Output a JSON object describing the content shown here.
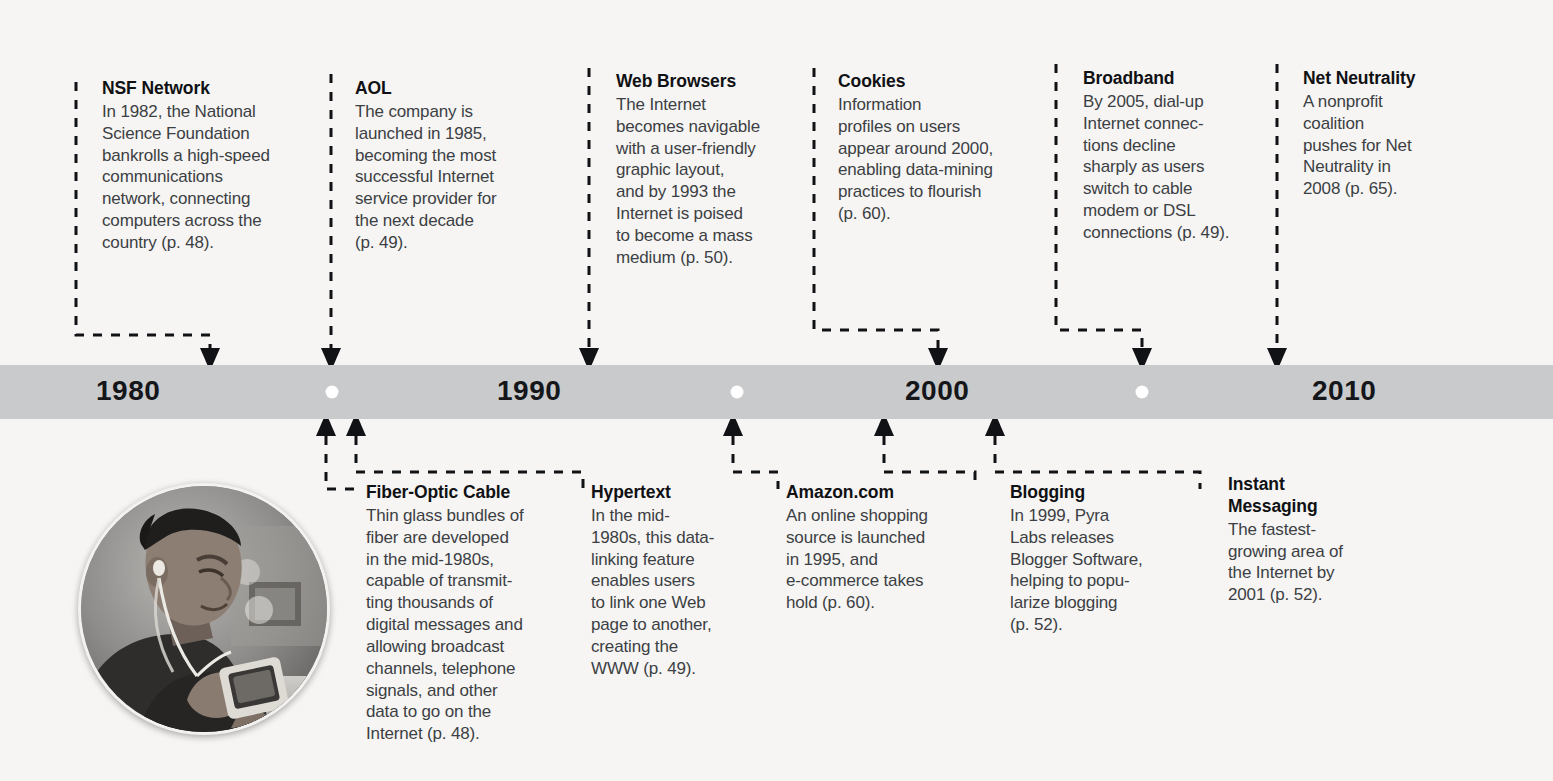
{
  "timeline": {
    "years": [
      {
        "label": "1980",
        "x": 96
      },
      {
        "label": "1990",
        "x": 497
      },
      {
        "label": "2000",
        "x": 905
      },
      {
        "label": "2010",
        "x": 1312
      }
    ],
    "dots": [
      {
        "name": "decade-marker-1985",
        "x": 332
      },
      {
        "name": "decade-marker-1995",
        "x": 737
      },
      {
        "name": "decade-marker-2005",
        "x": 1142
      }
    ],
    "bar_color": "#c9cacb",
    "background_color": "#f6f5f3",
    "ink_color": "#111216"
  },
  "entries_above": [
    {
      "id": "nsf-network",
      "title": "NSF Network",
      "body": "In 1982, the National\nScience Foundation\nbankrolls a high-speed\ncommunications\nnetwork, connecting\ncomputers across the\ncountry (p. 48)."
    },
    {
      "id": "aol",
      "title": "AOL",
      "body": "The company is\nlaunched in 1985,\nbecoming the most\nsuccessful Internet\nservice provider for\nthe next decade\n(p. 49)."
    },
    {
      "id": "web-browsers",
      "title": "Web Browsers",
      "body": "The Internet\nbecomes navigable\nwith a user-friendly\ngraphic layout,\nand by 1993 the\nInternet is poised\nto become a mass\nmedium (p. 50)."
    },
    {
      "id": "cookies",
      "title": "Cookies",
      "body": "Information\nprofiles on users\nappear around 2000,\nenabling data-mining\npractices to flourish\n(p. 60)."
    },
    {
      "id": "broadband",
      "title": "Broadband",
      "body": "By 2005, dial-up\nInternet connec-\ntions decline\nsharply as users\nswitch to cable\nmodem or DSL\nconnections (p. 49)."
    },
    {
      "id": "net-neutrality",
      "title": "Net Neutrality",
      "body": "A nonprofit\ncoalition\npushes for Net\nNeutrality in\n2008 (p. 65)."
    }
  ],
  "entries_below": [
    {
      "id": "fiber-optic-cable",
      "title": "Fiber-Optic Cable",
      "body": "Thin glass bundles of\nfiber are developed\nin the mid-1980s,\ncapable of transmit-\nting thousands of\ndigital messages and\nallowing broadcast\nchannels, telephone\nsignals, and other\ndata to go on the\nInternet (p. 48)."
    },
    {
      "id": "hypertext",
      "title": "Hypertext",
      "body": "In the mid-\n1980s, this data-\nlinking feature\nenables users\nto link one Web\npage to another,\ncreating the\nWWW (p. 49)."
    },
    {
      "id": "amazon-com",
      "title": "Amazon.com",
      "body": "An online shopping\nsource is launched\nin 1995, and\ne-commerce takes\nhold (p. 60)."
    },
    {
      "id": "blogging",
      "title": "Blogging",
      "body": "In 1999, Pyra\nLabs releases\nBlogger Software,\nhelping to popu-\nlarize blogging\n(p. 52)."
    },
    {
      "id": "instant-messaging",
      "title": "Instant\nMessaging",
      "body": "The fastest-\ngrowing area of\nthe Internet by\n2001 (p. 52)."
    }
  ],
  "photo": {
    "alt": "Teen with earbuds using a handheld media player"
  }
}
